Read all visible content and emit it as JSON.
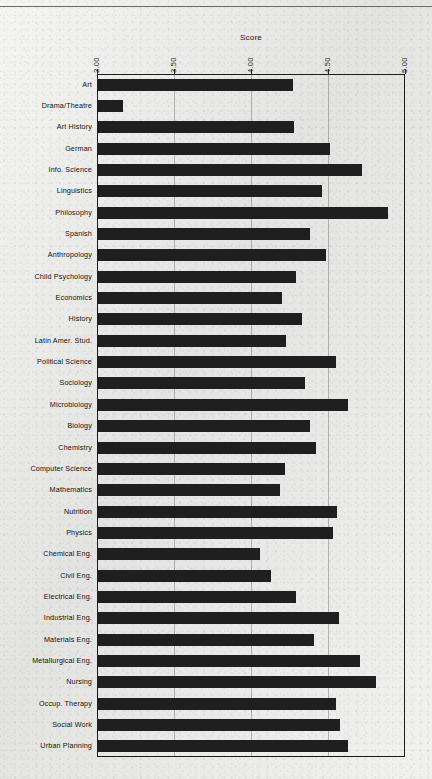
{
  "page": {
    "ghost_header": "",
    "top_rule": true
  },
  "chart_data": {
    "type": "bar",
    "orientation": "horizontal",
    "title": "",
    "xlabel": "Score",
    "ylabel": "",
    "xlim": [
      3.0,
      5.0
    ],
    "grid": true,
    "legend": "none",
    "xticks": [
      "3.00",
      "3.50",
      "4.00",
      "4.50",
      "5.00"
    ],
    "xtick_values": [
      3.0,
      3.5,
      4.0,
      4.5,
      5.0
    ],
    "bar_color": "#1f1f1f",
    "frame_color": "#1c1c1c",
    "grid_color": "#5a5a5a",
    "categories": [
      "Art",
      "Drama/Theatre",
      "Art History",
      "German",
      "Info. Science",
      "Linguistics",
      "Philosophy",
      "Spanish",
      "Anthropology",
      "Child Psychology",
      "Economics",
      "History",
      "Latin Amer. Stud.",
      "Political Science",
      "Sociology",
      "Microbiology",
      "Biology",
      "Chemistry",
      "Computer Science",
      "Mathematics",
      "Nutrition",
      "Physics",
      "Chemical Eng.",
      "Civil Eng.",
      "Electrical Eng.",
      "Industrial Eng.",
      "Materials Eng.",
      "Metallurgical Eng.",
      "Nursing",
      "Occup. Therapy",
      "Social Work",
      "Urban Planning"
    ],
    "values": [
      4.27,
      3.17,
      4.28,
      4.51,
      4.72,
      4.46,
      4.89,
      4.38,
      4.49,
      4.29,
      4.2,
      4.33,
      4.23,
      4.55,
      4.35,
      4.63,
      4.38,
      4.42,
      4.22,
      4.19,
      4.56,
      4.53,
      4.06,
      4.13,
      4.29,
      4.57,
      4.41,
      4.71,
      4.81,
      4.55,
      4.58,
      4.63
    ]
  }
}
